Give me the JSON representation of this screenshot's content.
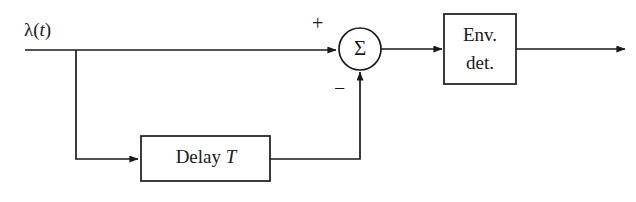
{
  "diagram": {
    "background_color": "#ffffff",
    "stroke_color": "#1a1a1a",
    "input": {
      "label_lambda": "λ",
      "label_paren_open": "(",
      "label_var": "t",
      "label_paren_close": ")",
      "name": "input-signal"
    },
    "summing_junction": {
      "symbol": "Σ",
      "plus_sign": "+",
      "minus_sign": "−",
      "name": "summing-junction"
    },
    "blocks": [
      {
        "id": "env-det",
        "line1": "Env.",
        "line2": "det."
      },
      {
        "id": "delay",
        "text": "Delay ",
        "var": "T"
      }
    ],
    "wires": {
      "input_to_sum": "input-to-sum-wire",
      "branch_to_delay": "branch-to-delay-wire",
      "delay_to_sum": "delay-to-sum-feedback-wire",
      "sum_to_envdet": "sum-to-envdet-wire",
      "envdet_to_output": "envdet-to-output-wire"
    }
  }
}
